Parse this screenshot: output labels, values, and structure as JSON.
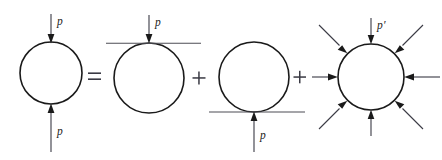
{
  "figure": {
    "background_color": "#ffffff",
    "curve_color": "#1a1a1a",
    "line_color": "#4d4d55",
    "label_color": "#1c1c22",
    "width": 442,
    "height": 160,
    "operators": [
      {
        "name": "equals",
        "symbol": "=",
        "x": 94,
        "y": 77
      },
      {
        "name": "plus-1",
        "symbol": "+",
        "x": 199,
        "y": 78
      },
      {
        "name": "plus-2",
        "symbol": "+",
        "x": 300,
        "y": 77
      }
    ],
    "terms": [
      {
        "id": "term-1",
        "name": "full-propagator-loop",
        "circle": {
          "cx": 51,
          "cy": 73,
          "r": 31
        },
        "labels": [
          {
            "name": "momentum-label-top",
            "text": "p",
            "prime": false,
            "x": 57,
            "y": 16
          },
          {
            "name": "momentum-label-bottom",
            "text": "p",
            "prime": false,
            "x": 57,
            "y": 126
          }
        ],
        "arrow_count": 2
      },
      {
        "id": "term-2",
        "name": "loop-with-top-tangent-line",
        "circle": {
          "cx": 149,
          "cy": 78,
          "r": 35
        },
        "tangent_line": {
          "position": "top",
          "x1": 106,
          "x2": 201,
          "y": 43
        },
        "labels": [
          {
            "name": "momentum-label-top",
            "text": "p",
            "prime": false,
            "x": 155,
            "y": 17
          }
        ],
        "arrow_count": 1
      },
      {
        "id": "term-3",
        "name": "loop-with-bottom-tangent-line",
        "circle": {
          "cx": 254,
          "cy": 77,
          "r": 35
        },
        "tangent_line": {
          "position": "bottom",
          "x1": 209,
          "x2": 305,
          "y": 112
        },
        "labels": [
          {
            "name": "momentum-label-bottom",
            "text": "p",
            "prime": false,
            "x": 260,
            "y": 130
          }
        ],
        "arrow_count": 1
      },
      {
        "id": "term-4",
        "name": "loop-with-eight-incoming-arrows",
        "circle": {
          "cx": 371,
          "cy": 77,
          "r": 33
        },
        "labels": [
          {
            "name": "momentum-label-top-primed",
            "text": "p",
            "prime": true,
            "x": 377,
            "y": 20
          }
        ],
        "arrow_count": 8,
        "arrow_angles_deg": [
          90,
          45,
          0,
          315,
          270,
          225,
          180,
          135
        ]
      }
    ]
  }
}
